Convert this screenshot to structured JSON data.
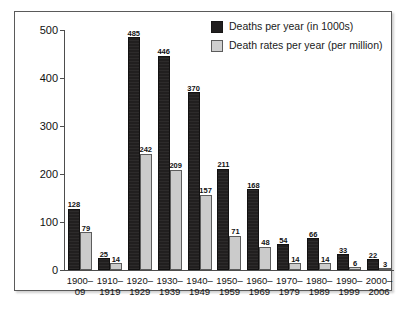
{
  "chart_data": {
    "type": "bar",
    "title": "",
    "subtitle": "",
    "xlabel": "",
    "ylabel": "",
    "ylim": [
      0,
      500
    ],
    "yticks": [
      0,
      100,
      200,
      300,
      400,
      500
    ],
    "grid": false,
    "legend_position": "top-right",
    "categories": [
      "1900–09",
      "1910–1919",
      "1920–1929",
      "1930–1939",
      "1940–1949",
      "1950–1959",
      "1960–1969",
      "1970–1979",
      "1980–1989",
      "1990–1999",
      "2000–2006"
    ],
    "category_lines": [
      [
        "1900–",
        "09"
      ],
      [
        "1910–",
        "1919"
      ],
      [
        "1920–",
        "1929"
      ],
      [
        "1930–",
        "1939"
      ],
      [
        "1940–",
        "1949"
      ],
      [
        "1950–",
        "1959"
      ],
      [
        "1960–",
        "1969"
      ],
      [
        "1970–",
        "1979"
      ],
      [
        "1980–",
        "1989"
      ],
      [
        "1990–",
        "1999"
      ],
      [
        "2000–",
        "2006"
      ]
    ],
    "series": [
      {
        "name": "Deaths per year (in 1000s)",
        "color": "#211f1f",
        "values": [
          128,
          25,
          485,
          446,
          370,
          211,
          168,
          54,
          66,
          33,
          22
        ]
      },
      {
        "name": "Death rates per year (per million)",
        "color": "#cbcbcb",
        "values": [
          79,
          14,
          242,
          209,
          157,
          71,
          48,
          14,
          14,
          6,
          3
        ]
      }
    ]
  },
  "legend": {
    "items": [
      {
        "label": "Deaths per year (in 1000s)",
        "swatch": "dark"
      },
      {
        "label": "Death rates per year (per million)",
        "swatch": "light"
      }
    ]
  },
  "axis": {
    "y_tick_labels": [
      "500",
      "400",
      "300",
      "200",
      "100",
      "0"
    ]
  },
  "colors": {
    "series_dark": "#211f1f",
    "series_light": "#cbcbcb",
    "axis": "#4d4d4d",
    "frame": "#5a5a5a",
    "text": "#111111",
    "background": "#ffffff"
  }
}
